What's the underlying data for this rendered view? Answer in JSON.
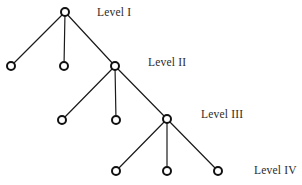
{
  "diagram": {
    "type": "hierarchical-tree",
    "title": "",
    "background_color": "#ffffff",
    "edge_color": "#1a1a1a",
    "node_fill_color": "#ffffff",
    "node_stroke_color": "#111111",
    "text_color": "#2b2b2b",
    "node_radius": 4,
    "node_stroke_width": 2,
    "edge_stroke_width": 1.2
  },
  "labels": [
    {
      "id": "label-level-1",
      "text": "Level I",
      "x": 97,
      "y": 6
    },
    {
      "id": "label-level-2",
      "text": "Level II",
      "x": 148,
      "y": 56
    },
    {
      "id": "label-level-3",
      "text": "Level III",
      "x": 201,
      "y": 108
    },
    {
      "id": "label-level-4",
      "text": "Level IV",
      "x": 254,
      "y": 164
    }
  ],
  "nodes": [
    {
      "id": "n-root",
      "level": 1,
      "x": 65,
      "y": 12
    },
    {
      "id": "n2-a",
      "level": 2,
      "x": 11,
      "y": 66
    },
    {
      "id": "n2-b",
      "level": 2,
      "x": 64,
      "y": 66
    },
    {
      "id": "n2-hub",
      "level": 2,
      "x": 115,
      "y": 66
    },
    {
      "id": "n3-a",
      "level": 3,
      "x": 62,
      "y": 120
    },
    {
      "id": "n3-b",
      "level": 3,
      "x": 116,
      "y": 120
    },
    {
      "id": "n3-hub",
      "level": 3,
      "x": 167,
      "y": 119
    },
    {
      "id": "n4-a",
      "level": 4,
      "x": 116,
      "y": 171
    },
    {
      "id": "n4-b",
      "level": 4,
      "x": 167,
      "y": 171
    },
    {
      "id": "n4-c",
      "level": 4,
      "x": 218,
      "y": 171
    }
  ],
  "edges": [
    {
      "id": "e-root-n2a",
      "from": "n-root",
      "to": "n2-a",
      "x1": 65,
      "y1": 12,
      "x2": 11,
      "y2": 66
    },
    {
      "id": "e-root-n2b",
      "from": "n-root",
      "to": "n2-b",
      "x1": 65,
      "y1": 12,
      "x2": 64,
      "y2": 66
    },
    {
      "id": "e-root-n2hub",
      "from": "n-root",
      "to": "n2-hub",
      "x1": 65,
      "y1": 12,
      "x2": 115,
      "y2": 66
    },
    {
      "id": "e-n2hub-n3a",
      "from": "n2-hub",
      "to": "n3-a",
      "x1": 115,
      "y1": 66,
      "x2": 62,
      "y2": 120
    },
    {
      "id": "e-n2hub-n3b",
      "from": "n2-hub",
      "to": "n3-b",
      "x1": 115,
      "y1": 66,
      "x2": 116,
      "y2": 120
    },
    {
      "id": "e-n2hub-n3hub",
      "from": "n2-hub",
      "to": "n3-hub",
      "x1": 115,
      "y1": 66,
      "x2": 167,
      "y2": 119
    },
    {
      "id": "e-n3hub-n4a",
      "from": "n3-hub",
      "to": "n4-a",
      "x1": 167,
      "y1": 119,
      "x2": 116,
      "y2": 171
    },
    {
      "id": "e-n3hub-n4b",
      "from": "n3-hub",
      "to": "n4-b",
      "x1": 167,
      "y1": 119,
      "x2": 167,
      "y2": 171
    },
    {
      "id": "e-n3hub-n4c",
      "from": "n3-hub",
      "to": "n4-c",
      "x1": 167,
      "y1": 119,
      "x2": 218,
      "y2": 171
    }
  ]
}
